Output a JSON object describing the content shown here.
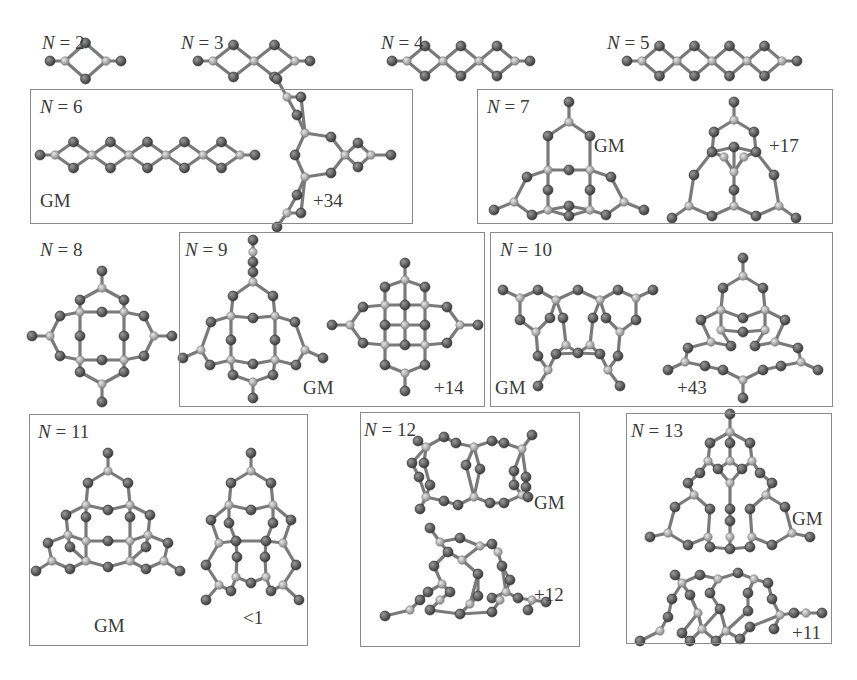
{
  "figure": {
    "colors": {
      "atom_dark": "#555555",
      "atom_light": "#b4b4b4",
      "bond": "#7a7a7a",
      "box_border": "#8a8a8a",
      "text": "#3a3a3a"
    },
    "panels": [
      {
        "id": "n2",
        "n_label": "N",
        "n_value": "= 2",
        "lx": 42,
        "ly": 33,
        "box": null,
        "annotations": []
      },
      {
        "id": "n3",
        "n_label": "N",
        "n_value": "= 3",
        "lx": 181,
        "ly": 33,
        "box": null,
        "annotations": []
      },
      {
        "id": "n4",
        "n_label": "N",
        "n_value": "= 4",
        "lx": 381,
        "ly": 33,
        "box": null,
        "annotations": []
      },
      {
        "id": "n5",
        "n_label": "N",
        "n_value": "= 5",
        "lx": 607,
        "ly": 33,
        "box": null,
        "annotations": []
      },
      {
        "id": "n6",
        "n_label": "N",
        "n_value": "= 6",
        "lx": 40,
        "ly": 97,
        "box": [
          30,
          89,
          383,
          135
        ],
        "annotations": [
          {
            "text": "GM",
            "x": 40,
            "y": 191
          },
          {
            "text": "+34",
            "x": 313,
            "y": 191
          }
        ]
      },
      {
        "id": "n7",
        "n_label": "N",
        "n_value": "= 7",
        "lx": 487,
        "ly": 97,
        "box": [
          477,
          89,
          356,
          135
        ],
        "annotations": [
          {
            "text": "GM",
            "x": 594,
            "y": 136
          },
          {
            "text": "+17",
            "x": 769,
            "y": 136
          }
        ]
      },
      {
        "id": "n8",
        "n_label": "N",
        "n_value": "= 8",
        "lx": 40,
        "ly": 240,
        "box": null,
        "annotations": []
      },
      {
        "id": "n9",
        "n_label": "N",
        "n_value": "= 9",
        "lx": 185,
        "ly": 240,
        "box": [
          179,
          232,
          306,
          175
        ],
        "annotations": [
          {
            "text": "GM",
            "x": 303,
            "y": 378
          },
          {
            "text": "+14",
            "x": 434,
            "y": 378
          }
        ]
      },
      {
        "id": "n10",
        "n_label": "N",
        "n_value": "= 10",
        "lx": 500,
        "ly": 240,
        "box": [
          490,
          232,
          343,
          175
        ],
        "annotations": [
          {
            "text": "GM",
            "x": 495,
            "y": 378
          },
          {
            "text": "+43",
            "x": 677,
            "y": 378
          }
        ]
      },
      {
        "id": "n11",
        "n_label": "N",
        "n_value": "= 11",
        "lx": 38,
        "ly": 422,
        "box": [
          29,
          414,
          279,
          232
        ],
        "annotations": [
          {
            "text": "GM",
            "x": 94,
            "y": 616
          },
          {
            "text": "<1",
            "x": 243,
            "y": 608
          }
        ]
      },
      {
        "id": "n12",
        "n_label": "N",
        "n_value": "= 12",
        "lx": 364,
        "ly": 420,
        "box": [
          360,
          412,
          220,
          235
        ],
        "annotations": [
          {
            "text": "GM",
            "x": 534,
            "y": 493
          },
          {
            "text": "+12",
            "x": 534,
            "y": 585
          }
        ]
      },
      {
        "id": "n13",
        "n_label": "N",
        "n_value": "= 13",
        "lx": 631,
        "ly": 421,
        "box": [
          626,
          413,
          206,
          231
        ],
        "annotations": [
          {
            "text": "GM",
            "x": 792,
            "y": 509
          },
          {
            "text": "+11",
            "x": 792,
            "y": 623
          }
        ]
      }
    ]
  },
  "molecules": {
    "chains": [
      {
        "id": "n2",
        "y": 61,
        "x0": 50,
        "units": 1,
        "unit_w": 41,
        "amp": 18
      },
      {
        "id": "n3",
        "y": 61,
        "x0": 198,
        "units": 2,
        "unit_w": 41,
        "amp": 16
      },
      {
        "id": "n4",
        "y": 61,
        "x0": 392,
        "units": 3,
        "unit_w": 36,
        "amp": 15
      },
      {
        "id": "n5",
        "y": 61,
        "x0": 627,
        "units": 4,
        "unit_w": 35,
        "amp": 15
      },
      {
        "id": "n6",
        "y": 155,
        "x0": 40,
        "units": 5,
        "unit_w": 37,
        "amp": 13
      }
    ],
    "n6_branch": {
      "center": [
        325,
        155
      ]
    },
    "n7_gm": {
      "cx": 569,
      "top": 102
    },
    "n7_iso": {
      "cx": 734,
      "top": 102
    },
    "n8": {
      "cx": 102,
      "cy": 326
    },
    "n9_gm": {
      "cx": 253,
      "cy": 330
    },
    "n9_iso": {
      "cx": 405,
      "cy": 325
    },
    "n10_gm": {
      "cx": 578,
      "cy": 320
    },
    "n10_iso": {
      "cx": 743,
      "cy": 330
    },
    "n11_gm": {
      "cx": 108,
      "cy": 545
    },
    "n11_iso": {
      "cx": 251,
      "cy": 545
    },
    "n12_gm": {
      "cx": 474,
      "cy": 475
    },
    "n12_iso": {
      "cx": 470,
      "cy": 580
    },
    "n13_gm": {
      "cx": 730,
      "cy": 505
    },
    "n13_iso": {
      "cx": 730,
      "cy": 605
    }
  }
}
